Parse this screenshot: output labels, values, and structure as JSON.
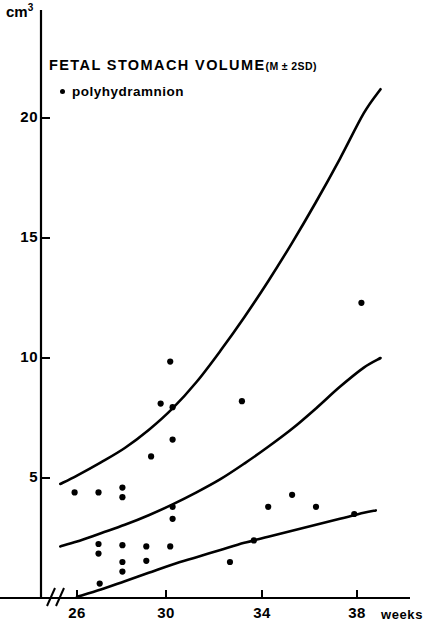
{
  "figure": {
    "title_main": "FETAL  STOMACH  VOLUME",
    "title_suffix": "(M ± 2SD)",
    "legend_marker_name": "filled-circle-marker",
    "legend_label": "polyhydramnion",
    "yaxis_unit": "cm",
    "yaxis_unit_exponent": "3",
    "xaxis_title": "weeks",
    "axis_break_symbol": "//"
  },
  "chart_data": {
    "type": "scatter",
    "xlabel": "weeks",
    "ylabel": "cm3",
    "xlim": [
      24.6,
      39.6
    ],
    "ylim": [
      0,
      22.5
    ],
    "xticks": [
      26,
      30,
      34,
      38
    ],
    "xtick_labels": [
      "26",
      "30",
      "34",
      "38"
    ],
    "yticks": [
      5,
      10,
      15,
      20
    ],
    "ytick_labels": [
      "5",
      "10",
      "15",
      "20"
    ],
    "grid": false,
    "legend_position": "upper-left",
    "axis_break": true,
    "series": [
      {
        "name": "+2SD",
        "type": "line",
        "x": [
          25.3,
          26.0,
          27.0,
          28.0,
          29.0,
          30.0,
          31.0,
          32.0,
          33.0,
          34.0,
          35.0,
          36.0,
          37.0,
          38.0,
          38.7
        ],
        "values": [
          4.75,
          5.1,
          5.65,
          6.25,
          7.0,
          7.9,
          9.0,
          10.3,
          11.7,
          13.2,
          14.8,
          16.5,
          18.3,
          20.2,
          21.2
        ]
      },
      {
        "name": "M",
        "type": "line",
        "x": [
          25.3,
          26.0,
          27.0,
          28.0,
          29.0,
          30.0,
          31.0,
          32.0,
          33.0,
          34.0,
          35.0,
          36.0,
          37.0,
          38.0,
          38.7
        ],
        "values": [
          2.15,
          2.35,
          2.7,
          3.05,
          3.45,
          3.9,
          4.4,
          4.95,
          5.6,
          6.3,
          7.05,
          7.9,
          8.8,
          9.6,
          10.0
        ]
      },
      {
        "name": "-2SD",
        "type": "line",
        "x": [
          26.0,
          27.0,
          28.0,
          29.0,
          30.0,
          31.0,
          32.0,
          33.0,
          34.0,
          35.0,
          36.0,
          37.0,
          38.0,
          38.5
        ],
        "values": [
          0.05,
          0.35,
          0.7,
          1.05,
          1.4,
          1.7,
          2.0,
          2.3,
          2.55,
          2.8,
          3.05,
          3.3,
          3.55,
          3.65
        ]
      },
      {
        "name": "polyhydramnion",
        "type": "scatter",
        "points": [
          [
            25.9,
            4.4
          ],
          [
            26.9,
            4.4
          ],
          [
            27.9,
            4.6
          ],
          [
            27.9,
            4.2
          ],
          [
            26.9,
            2.25
          ],
          [
            26.9,
            1.85
          ],
          [
            27.9,
            2.2
          ],
          [
            27.9,
            1.5
          ],
          [
            27.9,
            1.1
          ],
          [
            26.95,
            0.6
          ],
          [
            29.9,
            9.85
          ],
          [
            30.0,
            7.95
          ],
          [
            29.5,
            8.1
          ],
          [
            30.0,
            6.6
          ],
          [
            29.1,
            5.9
          ],
          [
            30.0,
            3.8
          ],
          [
            30.0,
            3.3
          ],
          [
            29.9,
            2.15
          ],
          [
            28.9,
            2.15
          ],
          [
            28.9,
            1.55
          ],
          [
            32.9,
            8.2
          ],
          [
            32.4,
            1.5
          ],
          [
            33.4,
            2.4
          ],
          [
            34.0,
            3.8
          ],
          [
            35.0,
            4.3
          ],
          [
            36.0,
            3.8
          ],
          [
            37.9,
            12.3
          ],
          [
            37.6,
            3.5
          ]
        ]
      }
    ]
  }
}
